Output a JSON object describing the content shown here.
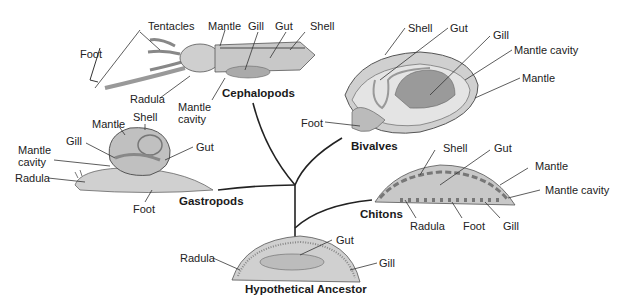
{
  "groups": {
    "cephalopods": "Cephalopods",
    "bivalves": "Bivalves",
    "gastropods": "Gastropods",
    "chitons": "Chitons",
    "ancestor": "Hypothetical Ancestor"
  },
  "labels": {
    "cephalopods": {
      "tentacles": "Tentacles",
      "mantle": "Mantle",
      "gill": "Gill",
      "gut": "Gut",
      "shell": "Shell",
      "foot": "Foot",
      "radula": "Radula",
      "mantle_cavity_1": "Mantle",
      "mantle_cavity_2": "cavity"
    },
    "bivalves": {
      "shell": "Shell",
      "gut": "Gut",
      "gill": "Gill",
      "mantle_cavity": "Mantle cavity",
      "mantle": "Mantle",
      "foot": "Foot"
    },
    "gastropods": {
      "mantle": "Mantle",
      "shell": "Shell",
      "gill": "Gill",
      "mantle_cavity_1": "Mantle",
      "mantle_cavity_2": "cavity",
      "gut": "Gut",
      "radula": "Radula",
      "foot": "Foot"
    },
    "chitons": {
      "shell": "Shell",
      "gut": "Gut",
      "mantle": "Mantle",
      "mantle_cavity": "Mantle cavity",
      "radula": "Radula",
      "foot": "Foot",
      "gill": "Gill"
    },
    "ancestor": {
      "radula": "Radula",
      "gut": "Gut",
      "gill": "Gill"
    }
  }
}
